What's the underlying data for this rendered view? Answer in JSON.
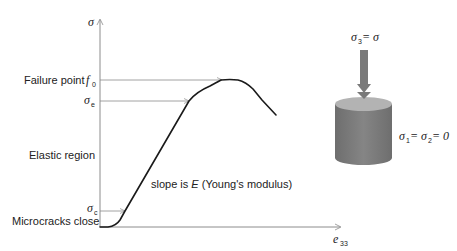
{
  "diagram": {
    "title": "",
    "axes": {
      "y_label": "σ",
      "x_label": "e",
      "x_label_sub": "33"
    },
    "levels": [
      {
        "name": "failure",
        "text": "Failure point",
        "symbol": "f",
        "symbol_sub": "0"
      },
      {
        "name": "elastic-limit",
        "symbol": "σ",
        "symbol_sub": "e"
      },
      {
        "name": "crack-closure",
        "symbol": "σ",
        "symbol_sub": "c"
      }
    ],
    "region_labels": {
      "elastic": "Elastic region",
      "microcracks": "Microcracks close"
    },
    "slope_annotation": {
      "prefix": "slope is ",
      "symbol": "E",
      "suffix": " (Young's modulus)"
    },
    "specimen": {
      "load_label": "σ",
      "load_label_sub": "3",
      "load_label_rhs": " = σ",
      "lateral_label_a": "σ",
      "lateral_label_a_sub": "1",
      "lateral_label_mid": " = σ",
      "lateral_label_b_sub": "2",
      "lateral_label_rhs": " = 0"
    },
    "colors": {
      "curve": "#1a1a1a",
      "axis": "#8c8c8c",
      "guide": "#8c8c8c",
      "cylinder_body": "#7f7f7f",
      "cylinder_top": "#b3b3b3",
      "load_arrow": "#7a7a7a"
    }
  }
}
